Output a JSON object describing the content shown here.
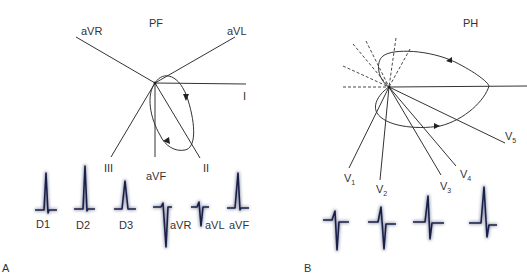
{
  "panels": [
    {
      "id": "A",
      "panel_label": "A",
      "plane_label": "PF",
      "axes": {
        "aVR": "aVR",
        "aVL": "aVL",
        "I": "I",
        "III": "III",
        "aVF": "aVF",
        "II": "II"
      },
      "complexes": [
        {
          "label": "D1",
          "polarity": "positive"
        },
        {
          "label": "D2",
          "polarity": "positive"
        },
        {
          "label": "D3",
          "polarity": "positive"
        },
        {
          "label": "aVR",
          "polarity": "negative"
        },
        {
          "label": "aVL",
          "polarity": "biphasic"
        },
        {
          "label": "aVF",
          "polarity": "positive"
        }
      ]
    },
    {
      "id": "B",
      "panel_label": "B",
      "plane_label": "PH",
      "axes": {
        "V1": {
          "base": "V",
          "sub": "1"
        },
        "V2": {
          "base": "V",
          "sub": "2"
        },
        "V3": {
          "base": "V",
          "sub": "3"
        },
        "V4": {
          "base": "V",
          "sub": "4"
        },
        "V5": {
          "base": "V",
          "sub": "5"
        }
      },
      "complexes": [
        {
          "label": "V1",
          "polarity": "negative"
        },
        {
          "label": "V2",
          "polarity": "negative"
        },
        {
          "label": "V3",
          "polarity": "biphasic"
        },
        {
          "label": "V4",
          "polarity": "positive"
        }
      ]
    }
  ],
  "colors": {
    "lines": "#333333",
    "complex": "#1a1f4a",
    "text": "#333333"
  }
}
